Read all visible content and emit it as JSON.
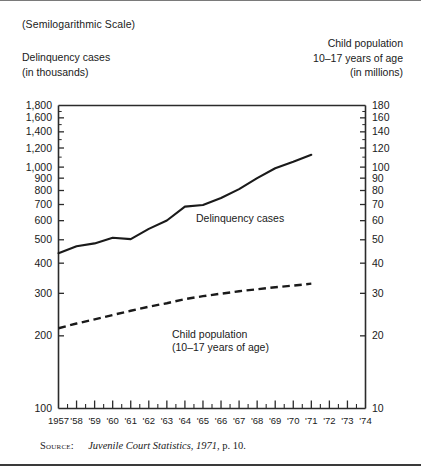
{
  "figure": {
    "scale_note": "(Semilogarithmic Scale)",
    "left_caption_line1": "Delinquency cases",
    "left_caption_line2": "(in thousands)",
    "right_caption_line1": "Child population",
    "right_caption_line2": "10–17 years of age",
    "right_caption_line3": "(in millions)"
  },
  "source": {
    "label": "Source:",
    "title": "Juvenile Court Statistics, 1971",
    "page": ", p. 10."
  },
  "chart_data": {
    "type": "line",
    "title": "",
    "subtitle": "(Semilogarithmic Scale)",
    "scale": "semilogarithmic",
    "xlabel": "",
    "ylabel": "Delinquency cases (in thousands)",
    "y2label": "Child population 10–17 years of age (in millions)",
    "grid": false,
    "legend": "inline-annotations",
    "x": [
      1957,
      1958,
      1959,
      1960,
      1961,
      1962,
      1963,
      1964,
      1965,
      1966,
      1967,
      1968,
      1969,
      1970,
      1971
    ],
    "xtick_labels": [
      "1957",
      "'58",
      "'59",
      "'60",
      "'61",
      "'62",
      "'63",
      "'64",
      "'65",
      "'66",
      "'67",
      "'68",
      "'69",
      "'70",
      "'71",
      "'72",
      "'73",
      "'74"
    ],
    "xlim": [
      1957,
      1974
    ],
    "ylim": [
      100,
      1800
    ],
    "ytick_labels": [
      "1,800",
      "1,600",
      "1,400",
      "1,200",
      "1,000",
      "900",
      "800",
      "700",
      "600",
      "500",
      "400",
      "300",
      "200",
      "100"
    ],
    "ytick_values": [
      1800,
      1600,
      1400,
      1200,
      1000,
      900,
      800,
      700,
      600,
      500,
      400,
      300,
      200,
      100
    ],
    "y2lim": [
      10,
      180
    ],
    "y2tick_labels": [
      "180",
      "160",
      "140",
      "120",
      "100",
      "90",
      "80",
      "70",
      "60",
      "50",
      "40",
      "30",
      "20",
      "10"
    ],
    "y2tick_values": [
      180,
      160,
      140,
      120,
      100,
      90,
      80,
      70,
      60,
      50,
      40,
      30,
      20,
      10
    ],
    "series": [
      {
        "name": "Delinquency cases",
        "label_line1": "Delinquency cases",
        "label_line2": "",
        "axis": "left",
        "units": "thousands",
        "style": "solid",
        "values": [
          440,
          470,
          483,
          510,
          503,
          555,
          601,
          686,
          697,
          745,
          811,
          900,
          989,
          1052,
          1125
        ]
      },
      {
        "name": "Child population",
        "label_line1": "Child population",
        "label_line2": "(10–17 years of age)",
        "axis": "right",
        "units": "millions",
        "style": "dashed",
        "values": [
          21.5,
          22.5,
          23.4,
          24.4,
          25.4,
          26.4,
          27.3,
          28.4,
          29.2,
          29.9,
          30.6,
          31.2,
          31.8,
          32.3,
          32.9
        ]
      }
    ]
  },
  "axes": {
    "left_ticks": [
      {
        "label": "1,800",
        "value": 1800
      },
      {
        "label": "1,600",
        "value": 1600
      },
      {
        "label": "1,400",
        "value": 1400
      },
      {
        "label": "1,200",
        "value": 1200
      },
      {
        "label": "1,000",
        "value": 1000
      },
      {
        "label": "900",
        "value": 900
      },
      {
        "label": "800",
        "value": 800
      },
      {
        "label": "700",
        "value": 700
      },
      {
        "label": "600",
        "value": 600
      },
      {
        "label": "500",
        "value": 500
      },
      {
        "label": "400",
        "value": 400
      },
      {
        "label": "300",
        "value": 300
      },
      {
        "label": "200",
        "value": 200
      },
      {
        "label": "100",
        "value": 100
      }
    ],
    "right_ticks": [
      {
        "label": "180",
        "value": 180
      },
      {
        "label": "160",
        "value": 160
      },
      {
        "label": "140",
        "value": 140
      },
      {
        "label": "120",
        "value": 120
      },
      {
        "label": "100",
        "value": 100
      },
      {
        "label": "90",
        "value": 90
      },
      {
        "label": "80",
        "value": 80
      },
      {
        "label": "70",
        "value": 70
      },
      {
        "label": "60",
        "value": 60
      },
      {
        "label": "50",
        "value": 50
      },
      {
        "label": "40",
        "value": 40
      },
      {
        "label": "30",
        "value": 30
      },
      {
        "label": "20",
        "value": 20
      },
      {
        "label": "10",
        "value": 10
      }
    ],
    "x_ticks": [
      "1957",
      "'58",
      "'59",
      "'60",
      "'61",
      "'62",
      "'63",
      "'64",
      "'65",
      "'66",
      "'67",
      "'68",
      "'69",
      "'70",
      "'71",
      "'72",
      "'73",
      "'74"
    ]
  },
  "colors": {
    "ink": "#1a1a1a",
    "frame": "#2b2b2b",
    "rule": "#7a7a7a",
    "background": "#ffffff"
  }
}
